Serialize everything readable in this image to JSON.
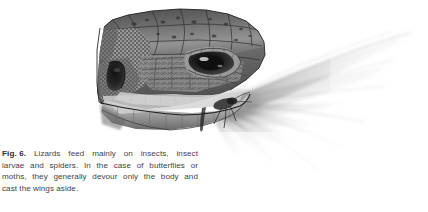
{
  "page": {
    "background_color": "#ffffff",
    "width": 428,
    "height": 212
  },
  "figure": {
    "label": "Fig. 6.",
    "caption_full": "Lizards feed mainly on insects, insect larvae and spiders. In the case of butterflies or moths, they generally devour only the body and cast the wings aside.",
    "caption_lines": [
      "Lizards feed mainly on insects, insect",
      "larvae and spiders. In the case of butterflies or",
      "moths, they generally devour only the body and",
      "cast the wings aside."
    ],
    "caption_line_1_words": [
      "Lizards",
      "feed",
      "mainly",
      "on",
      "insects,",
      "insect"
    ],
    "caption_line_2_words": [
      "larvae",
      "and",
      "spiders.",
      "In",
      "the",
      "case",
      "of",
      "butterflies",
      "or"
    ],
    "caption_line_3_words": [
      "moths,",
      "they",
      "generally",
      "devour",
      "only",
      "the",
      "body",
      "and"
    ],
    "caption_line_4": "cast the wings aside.",
    "text_color": "#3f3f3f",
    "label_color": "#2b2b2b"
  },
  "illustration": {
    "title": "Lizard head devouring a moth",
    "medium": "graphite pencil drawing",
    "palette": {
      "darkest": "#1d1d1d",
      "dark": "#3a3a3a",
      "mid": "#6e6e6e",
      "light": "#a8a8a8",
      "pale": "#d8d8d8",
      "wing_faint": "#efefef",
      "paper": "#ffffff"
    },
    "subjects": [
      {
        "name": "lizard-head",
        "facing": "right",
        "parts": [
          "snout",
          "head-plates",
          "eye",
          "ear-opening",
          "jaw",
          "neck-scales",
          "granular-temporal-scales"
        ]
      },
      {
        "name": "moth",
        "held_in": "jaws",
        "parts": [
          "body",
          "forewings",
          "hindwings",
          "legs"
        ],
        "wing_direction": "upper-right fan"
      }
    ]
  }
}
